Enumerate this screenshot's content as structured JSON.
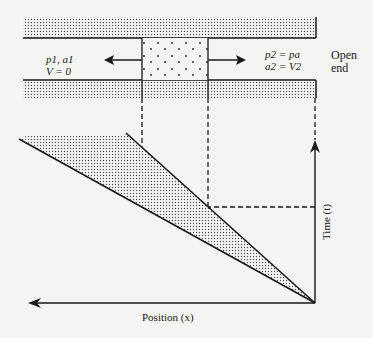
{
  "diagram": {
    "type": "x-t wave diagram (expansion wave in tube with open end)",
    "left_state": {
      "line1": "p1, a1",
      "line2": "V = 0"
    },
    "right_state": {
      "line1": "p2 = pa",
      "line2": "a2 = V2"
    },
    "open_end": {
      "line1": "Open",
      "line2": "end"
    },
    "axes": {
      "x_label": "Position (x)",
      "t_label": "Time (t)"
    },
    "colors": {
      "line": "#1a1a1a",
      "background": "#f4f4f2",
      "stipple": "#555555"
    }
  }
}
